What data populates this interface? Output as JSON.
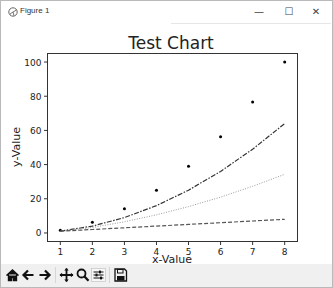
{
  "window": {
    "title": "Figure 1",
    "controls": {
      "minimize": "—",
      "maximize": "☐",
      "close": "✕"
    }
  },
  "toolbar": {
    "buttons": [
      {
        "name": "home",
        "label": "Home"
      },
      {
        "name": "back",
        "label": "Back"
      },
      {
        "name": "forward",
        "label": "Forward"
      },
      {
        "name": "pan",
        "label": "Pan"
      },
      {
        "name": "zoom",
        "label": "Zoom"
      },
      {
        "name": "configure",
        "label": "Configure subplots"
      },
      {
        "name": "save",
        "label": "Save"
      }
    ]
  },
  "chart_data": {
    "type": "line",
    "title": "Test Chart",
    "xlabel": "x-Value",
    "ylabel": "y-Value",
    "x": [
      1,
      2,
      3,
      4,
      5,
      6,
      7,
      8
    ],
    "xticks": [
      1,
      2,
      3,
      4,
      5,
      6,
      7,
      8
    ],
    "yticks": [
      0,
      20,
      40,
      60,
      80,
      100
    ],
    "xlim": [
      0.6,
      8.4
    ],
    "ylim": [
      -5,
      105
    ],
    "grid": false,
    "legend": null,
    "series": [
      {
        "name": "points",
        "style": "markers",
        "color": "#000000",
        "values": [
          1.6,
          6.3,
          14.1,
          25,
          39.1,
          56.3,
          76.6,
          100
        ]
      },
      {
        "name": "dash-dot",
        "style": "dashdot",
        "color": "#333333",
        "values": [
          1,
          4,
          9,
          16,
          25,
          36,
          49,
          64
        ]
      },
      {
        "name": "dotted",
        "style": "dotted",
        "color": "#999999",
        "values": [
          1,
          3.2,
          6.5,
          10.6,
          15.4,
          21.0,
          27.3,
          34.3
        ]
      },
      {
        "name": "dashed",
        "style": "dashed",
        "color": "#555555",
        "values": [
          1,
          2,
          3,
          4,
          5,
          6,
          7,
          8
        ]
      }
    ]
  }
}
